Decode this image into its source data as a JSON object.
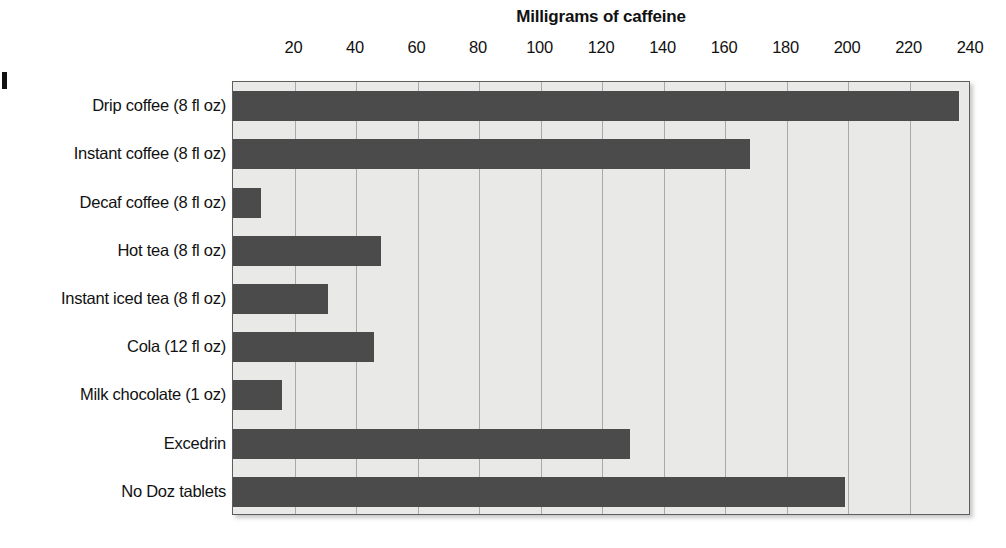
{
  "chart_data": {
    "type": "bar",
    "orientation": "horizontal",
    "title": "Milligrams of caffeine",
    "xlabel": "",
    "ylabel": "",
    "xlim": [
      0,
      240
    ],
    "grid": true,
    "legend": false,
    "legend_position": "none",
    "tick_step": 20,
    "tick_labels": [
      "20",
      "40",
      "60",
      "80",
      "100",
      "120",
      "140",
      "160",
      "180",
      "200",
      "220",
      "240"
    ],
    "ticks": [
      20,
      40,
      60,
      80,
      100,
      120,
      140,
      160,
      180,
      200,
      220,
      240
    ],
    "categories": [
      "Drip coffee (8 fl oz)",
      "Instant coffee (8 fl oz)",
      "Decaf coffee (8 fl oz)",
      "Hot tea (8 fl oz)",
      "Instant iced tea (8 fl oz)",
      "Cola (12 fl oz)",
      "Milk chocolate (1 oz)",
      "Excedrin",
      "No Doz tablets"
    ],
    "values": [
      236,
      168,
      9,
      48,
      31,
      46,
      16,
      129,
      199
    ],
    "units": "mg"
  },
  "colors": {
    "bar": "#4b4b4b",
    "plot_background": "#e9e9e7",
    "gridline": "#a9a9a9",
    "plot_border": "#5d5d5d",
    "text": "#111111",
    "page_background": "#ffffff"
  }
}
